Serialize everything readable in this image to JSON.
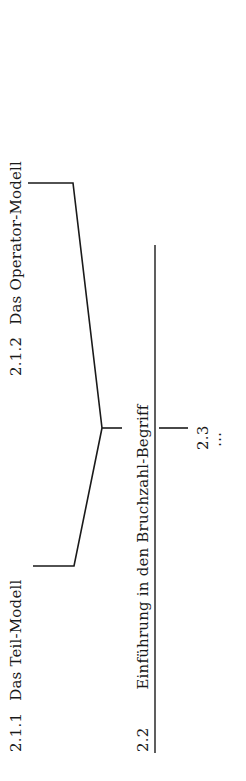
{
  "diagram": {
    "orientation": "rotated-90-ccw",
    "nodes": {
      "n211": {
        "number": "2.1.1",
        "label": "Das Teil-Modell"
      },
      "n212": {
        "number": "2.1.2",
        "label": "Das Operator-Modell"
      },
      "n22": {
        "number": "2.2",
        "label": "Einführung in den Bruchzahl-Begriff"
      },
      "n23": {
        "number": "2.3",
        "continuation": "⋯"
      }
    },
    "edges": [
      {
        "from": "n211",
        "to": "n22",
        "type": "bracket-merge"
      },
      {
        "from": "n212",
        "to": "n22",
        "type": "bracket-merge"
      },
      {
        "from": "n22",
        "to": "n23",
        "type": "straight"
      }
    ],
    "colors": {
      "line": "#1a1a1a",
      "text": "#1a1a1a",
      "background": "#ffffff"
    }
  }
}
